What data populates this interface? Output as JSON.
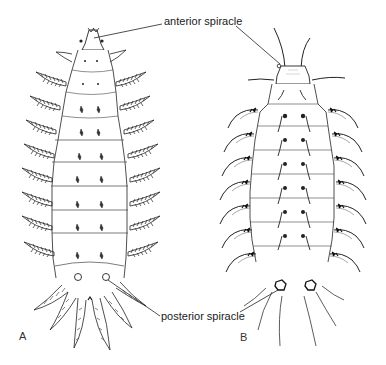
{
  "figure": {
    "labels": {
      "anterior": "anterior spiracle",
      "posterior": "posterior spiracle"
    },
    "panels": [
      {
        "letter": "A",
        "description": "larva with feather-like (plumose) lateral processes, dorsal view"
      },
      {
        "letter": "B",
        "description": "larva with slender tapering lateral processes, dorsal view"
      }
    ],
    "colors": {
      "ink": "#1a1a1a",
      "background": "#ffffff"
    }
  }
}
